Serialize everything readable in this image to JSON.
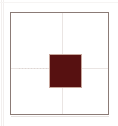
{
  "figure": {
    "title": "",
    "background_color": "#ffffff",
    "panel": {
      "name": "plot-panel",
      "border_color": "#8b7b76",
      "border_width_px": 1,
      "fill_color": "#ffffff",
      "left_px": 10,
      "top_px": 12,
      "width_px": 99,
      "height_px": 103
    },
    "gridlines": {
      "color": "#eae5e3",
      "vertical_x_px": 51,
      "horizontal_y_px": 55,
      "style": "solid-with-dashed-segment"
    },
    "marker": {
      "name": "data-square",
      "shape": "square",
      "fill_color": "#571111",
      "edge_color": "#c8a79d",
      "left_px": 38,
      "top_px": 41,
      "width_px": 33,
      "height_px": 34
    }
  },
  "chart_data": {
    "type": "scatter",
    "title": "",
    "xlabel": "",
    "ylabel": "",
    "xlim": [
      -1,
      1
    ],
    "ylim": [
      -1,
      1
    ],
    "grid": true,
    "legend": null,
    "axis_ticks_visible": false,
    "series": [
      {
        "name": "marker",
        "marker": "square",
        "color": "#571111",
        "edgecolor": "#c8a79d",
        "size": 0.33,
        "x": [
          0.04
        ],
        "y": [
          0.02
        ]
      }
    ],
    "annotations": [
      {
        "kind": "crosshair-vertical",
        "x": 0.04,
        "color": "#eae5e3"
      },
      {
        "kind": "crosshair-horizontal",
        "y": 0.02,
        "color": "#eae5e3"
      }
    ]
  }
}
